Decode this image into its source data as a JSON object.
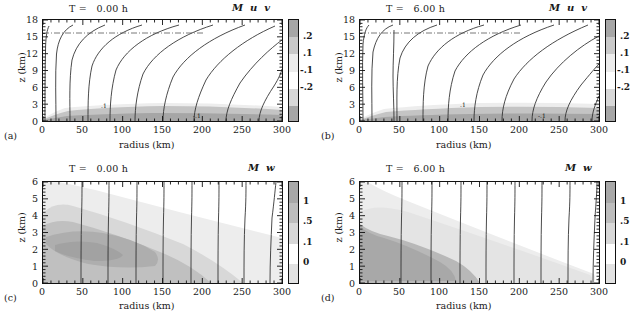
{
  "figure": {
    "width": 634,
    "height": 317,
    "panel_count": 4
  },
  "axes": {
    "xlabel": "radius (km)",
    "ylabel": "z (km)",
    "x_ticks": [
      "0",
      "50",
      "100",
      "150",
      "200",
      "250",
      "300"
    ],
    "x_values": [
      0,
      50,
      100,
      150,
      200,
      250,
      300
    ],
    "x_range": [
      0,
      300
    ],
    "y_ticks_top": [
      "0",
      "3",
      "6",
      "9",
      "12",
      "15",
      "18"
    ],
    "y_values_top": [
      0,
      3,
      6,
      9,
      12,
      15,
      18
    ],
    "y_range_top": [
      0,
      18
    ],
    "y_ticks_bottom": [
      "0",
      "1",
      "2",
      "3",
      "4",
      "5",
      "6"
    ],
    "y_values_bottom": [
      0,
      1,
      2,
      3,
      4,
      5,
      6
    ],
    "y_range_bottom": [
      0,
      6
    ]
  },
  "colors": {
    "shade_dark": "#a6a6a6",
    "shade_mid": "#c4c4c4",
    "shade_light": "#dcdcdc",
    "shade_pale": "#ededed",
    "white": "#ffffff",
    "contour": "#2b2b2b",
    "frame": "#111111"
  },
  "colorbar_top": {
    "labels": [
      ".2",
      ".1",
      "-.1",
      "-.2"
    ],
    "values": [
      0.2,
      0.1,
      -0.1,
      -0.2
    ],
    "segment_colors": [
      "#a6a6a6",
      "#c9c9c9",
      "#ececec",
      "#ffffff",
      "#d8d8d8",
      "#a6a6a6"
    ]
  },
  "colorbar_bottom": {
    "labels": [
      "1",
      ".5",
      ".1",
      "0"
    ],
    "values": [
      1,
      0.5,
      0.1,
      0
    ],
    "segment_colors": [
      "#a8a8a8",
      "#bdbdbd",
      "#d8d8d8",
      "#ffffff",
      "#e2e2e2"
    ]
  },
  "panels": [
    {
      "tag": "(a)",
      "title": "T =   0.00 h",
      "vars": "M  u  v",
      "z_max": 18,
      "contour_label_1": ".1",
      "contour_label_2": "-.1"
    },
    {
      "tag": "(b)",
      "title": "T =   6.00 h",
      "vars": "M  u  v",
      "z_max": 18,
      "contour_label_1": ".1",
      "contour_label_2": "-.1"
    },
    {
      "tag": "(c)",
      "title": "T =   0.00 h",
      "vars": "M  w",
      "z_max": 6,
      "contour_label_1": "",
      "contour_label_2": ""
    },
    {
      "tag": "(d)",
      "title": "T =   6.00 h",
      "vars": "M  w",
      "z_max": 6,
      "contour_label_1": "",
      "contour_label_2": ""
    }
  ],
  "chart_data": {
    "type": "line",
    "xlabel": "radius (km)",
    "ylabel": "z (km)",
    "xlim": [
      0,
      300
    ],
    "grid": false,
    "legend": "none",
    "panels": [
      {
        "tag": "(a)",
        "time_hours": 0.0,
        "ylim": [
          0,
          18
        ],
        "shaded_field": "u, v",
        "shaded_levels": [
          -0.2,
          -0.1,
          0.1,
          0.2
        ],
        "contour_field": "M",
        "contour_starts_x": [
          2,
          16,
          34,
          56,
          84,
          116,
          152,
          192,
          232,
          268
        ],
        "tropopause_z": 15.8,
        "boundary_layer_top_z": 3.0
      },
      {
        "tag": "(b)",
        "time_hours": 6.0,
        "ylim": [
          0,
          18
        ],
        "shaded_field": "u, v",
        "shaded_levels": [
          -0.2,
          -0.1,
          0.1,
          0.2
        ],
        "contour_field": "M",
        "contour_starts_x": [
          4,
          19,
          46,
          50,
          88,
          122,
          156,
          194,
          230,
          266
        ],
        "tropopause_z": 15.8,
        "boundary_layer_top_z": 2.7
      },
      {
        "tag": "(c)",
        "time_hours": 0.0,
        "ylim": [
          0,
          6
        ],
        "shaded_field": "w",
        "shaded_levels": [
          0,
          0.1,
          0.5,
          1
        ],
        "contour_field": "M",
        "contour_starts_x": [
          48,
          82,
          117,
          151,
          186,
          220,
          252,
          285
        ]
      },
      {
        "tag": "(d)",
        "time_hours": 6.0,
        "ylim": [
          0,
          6
        ],
        "shaded_field": "w",
        "shaded_levels": [
          0,
          0.1,
          0.5,
          1
        ],
        "contour_field": "M",
        "contour_starts_x": [
          52,
          89,
          125,
          158,
          193,
          227,
          262,
          290
        ]
      }
    ]
  }
}
